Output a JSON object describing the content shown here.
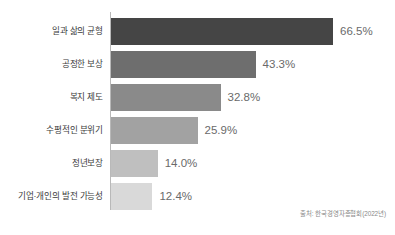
{
  "chart_data": {
    "type": "bar",
    "orientation": "horizontal",
    "title": "",
    "xlabel": "",
    "ylabel": "",
    "xlim": [
      0,
      70
    ],
    "grid": false,
    "legend": null,
    "categories": [
      "일과 삶의 균형",
      "공정한 보상",
      "복지 제도",
      "수평적인 분위기",
      "정년보장",
      "기업·개인의 발전 가능성"
    ],
    "values": [
      66.5,
      43.3,
      32.8,
      25.9,
      14.0,
      12.4
    ],
    "value_labels": [
      "66.5%",
      "43.3%",
      "32.8%",
      "25.9%",
      "14.0%",
      "12.4%"
    ],
    "bar_colors": [
      "#454545",
      "#6e6e6e",
      "#8a8a8a",
      "#a2a2a2",
      "#bfbfbf",
      "#d9d9d9"
    ],
    "source": "출처: 한국경영자총협회(2022년)"
  },
  "colors": {
    "axis": "#b9b9b9",
    "label_text": "#3b3b3b",
    "value_text": "#6a6a6a",
    "source_text": "#8a8a8a",
    "background": "#ffffff"
  }
}
